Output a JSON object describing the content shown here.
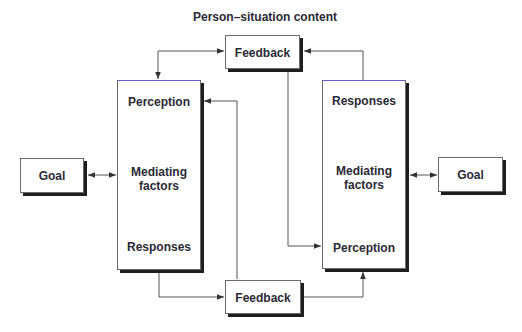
{
  "diagram": {
    "title": "Person–situation content",
    "left_goal": {
      "label": "Goal"
    },
    "right_goal": {
      "label": "Goal"
    },
    "top_feedback": {
      "label": "Feedback"
    },
    "bottom_feedback": {
      "label": "Feedback"
    },
    "left_process": {
      "top": "Perception",
      "middle_line1": "Mediating",
      "middle_line2": "factors",
      "bottom": "Responses"
    },
    "right_process": {
      "top": "Responses",
      "middle_line1": "Mediating",
      "middle_line2": "factors",
      "bottom": "Perception"
    },
    "colors": {
      "line": "#555555",
      "shadow": "#1e1e1e",
      "text": "#2a2a35",
      "box_top_accent": "#6a5acd"
    }
  }
}
